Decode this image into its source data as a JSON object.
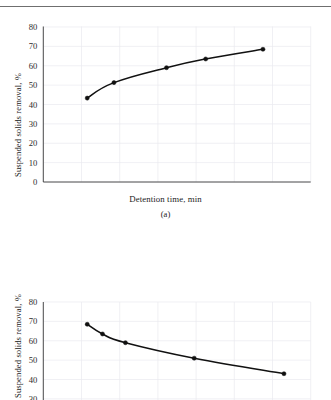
{
  "page": {
    "running_head": "",
    "background_color": "#ffffff",
    "ink_color": "#111111",
    "grid_color": "#e9e9ef"
  },
  "figures": [
    {
      "id": "a",
      "caption": "(a)",
      "xlabel": "Detention time, min",
      "ylabel": "Suspended solids removal, %"
    },
    {
      "id": "b",
      "caption": "(b)",
      "xlabel": "Detention time, min",
      "ylabel": "Suspended solids removal, %"
    }
  ],
  "chart_data": [
    {
      "type": "line",
      "panel": "(a)",
      "title": "",
      "xlabel": "Detention time, min",
      "ylabel": "Suspended solids removal, %",
      "xlim": [
        0,
        140
      ],
      "ylim": [
        0,
        80
      ],
      "xticks": [
        0,
        20,
        40,
        60,
        80,
        100,
        120,
        140
      ],
      "yticks": [
        0,
        10,
        20,
        30,
        40,
        50,
        60,
        70,
        80
      ],
      "xtick_labels": [
        "0",
        "20",
        "40",
        "60",
        "80",
        "100",
        "120",
        "140"
      ],
      "ytick_labels": [
        "0",
        "10",
        "20",
        "30",
        "40",
        "50",
        "60",
        "70",
        "80"
      ],
      "grid": true,
      "legend": "none",
      "markers": "filled circle",
      "series": [
        {
          "name": "Suspended solids removal",
          "x": [
            23,
            37,
            64.5,
            85,
            115
          ],
          "y": [
            43.3,
            51.3,
            59.0,
            63.5,
            68.5
          ]
        }
      ]
    },
    {
      "type": "line",
      "panel": "(b)",
      "title": "",
      "xlabel": "Detention time, min",
      "ylabel": "Suspended solids removal, %",
      "xlim": [
        0,
        140
      ],
      "ylim": [
        0,
        80
      ],
      "yticks": [
        10,
        20,
        30,
        40,
        50,
        60,
        70,
        80
      ],
      "ytick_labels": [
        "10",
        "20",
        "30",
        "40",
        "50",
        "60",
        "70",
        "80"
      ],
      "grid": true,
      "legend": "none",
      "markers": "filled circle",
      "clipped_bottom": true,
      "series": [
        {
          "name": "Suspended solids removal",
          "x": [
            23,
            31,
            43,
            79,
            126
          ],
          "y": [
            68.5,
            63.5,
            59.0,
            51.0,
            43.0
          ]
        }
      ]
    }
  ]
}
